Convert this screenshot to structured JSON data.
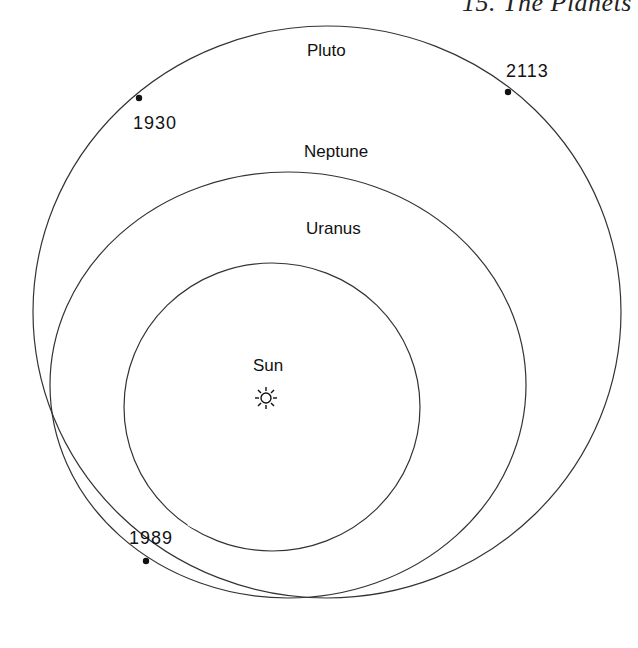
{
  "header": {
    "running_title": "15. The Planets"
  },
  "diagram": {
    "orbits": [
      {
        "name": "Pluto",
        "label": "Pluto"
      },
      {
        "name": "Neptune",
        "label": "Neptune"
      },
      {
        "name": "Uranus",
        "label": "Uranus"
      }
    ],
    "center": {
      "label": "Sun",
      "icon": "sun-icon"
    },
    "pluto_positions": [
      {
        "year": "1930"
      },
      {
        "year": "2113"
      },
      {
        "year": "1989"
      }
    ],
    "colors": {
      "line": "#333333",
      "text": "#111111",
      "background": "#ffffff"
    }
  }
}
